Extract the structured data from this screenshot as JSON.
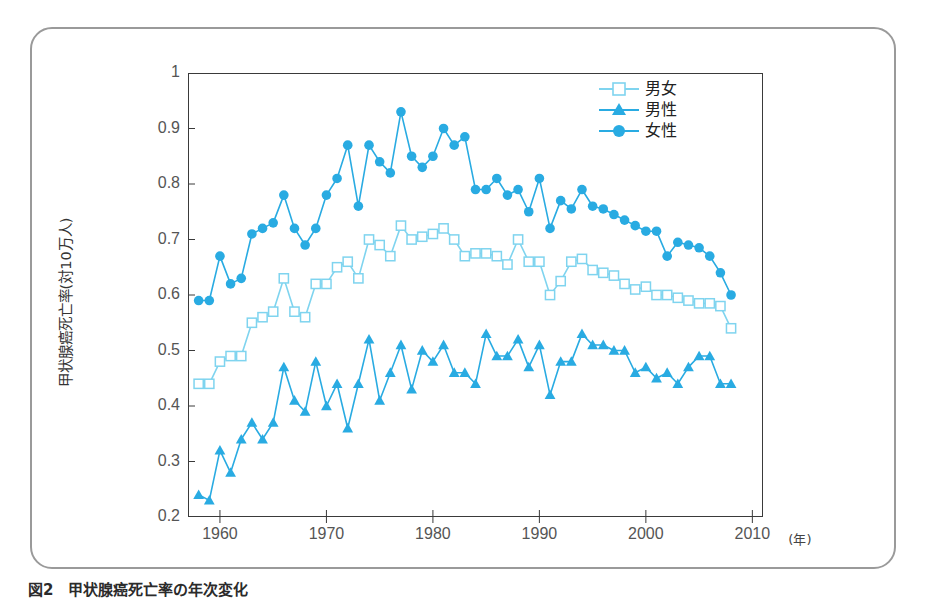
{
  "figure": {
    "top_fragment": "",
    "caption": "図2　甲状腺癌死亡率の年次変化"
  },
  "axes": {
    "y_title": "甲状腺癌死亡率(対10万人)",
    "y_ticks": [
      "0.2",
      "0.3",
      "0.4",
      "0.5",
      "0.6",
      "0.7",
      "0.8",
      "0.9",
      "1"
    ],
    "x_ticks": [
      "1960",
      "1970",
      "1980",
      "1990",
      "2000",
      "2010"
    ],
    "x_unit": "(年)"
  },
  "legend": {
    "position": "top-right",
    "items": [
      {
        "label": "男女",
        "marker": "open-square",
        "color": "#7FD4EF"
      },
      {
        "label": "男性",
        "marker": "filled-triangle",
        "color": "#29ABE2"
      },
      {
        "label": "女性",
        "marker": "filled-circle",
        "color": "#29ABE2"
      }
    ]
  },
  "colors": {
    "both": "#7FD4EF",
    "male": "#29ABE2",
    "female": "#29ABE2",
    "frame": "#3a3a3a",
    "outer_frame": "#9a9a9a"
  },
  "chart_data": {
    "type": "line",
    "title": "甲状腺癌死亡率の年次変化",
    "xlabel": "年",
    "ylabel": "甲状腺癌死亡率(対10万人)",
    "xlim": [
      1957,
      2011
    ],
    "ylim": [
      0.2,
      1.0
    ],
    "grid": false,
    "legend_position": "top-right",
    "x": [
      1958,
      1959,
      1960,
      1961,
      1962,
      1963,
      1964,
      1965,
      1966,
      1967,
      1968,
      1969,
      1970,
      1971,
      1972,
      1973,
      1974,
      1975,
      1976,
      1977,
      1978,
      1979,
      1980,
      1981,
      1982,
      1983,
      1984,
      1985,
      1986,
      1987,
      1988,
      1989,
      1990,
      1991,
      1992,
      1993,
      1994,
      1995,
      1996,
      1997,
      1998,
      1999,
      2000,
      2001,
      2002,
      2003,
      2004,
      2005,
      2006,
      2007,
      2008
    ],
    "series": [
      {
        "name": "男女",
        "marker": "open-square",
        "color": "#7FD4EF",
        "values": [
          0.44,
          0.44,
          0.48,
          0.49,
          0.49,
          0.55,
          0.56,
          0.57,
          0.63,
          0.57,
          0.56,
          0.62,
          0.62,
          0.65,
          0.66,
          0.63,
          0.7,
          0.69,
          0.67,
          0.725,
          0.7,
          0.705,
          0.71,
          0.72,
          0.7,
          0.67,
          0.675,
          0.675,
          0.67,
          0.655,
          0.7,
          0.66,
          0.66,
          0.6,
          0.625,
          0.66,
          0.665,
          0.645,
          0.64,
          0.635,
          0.62,
          0.61,
          0.615,
          0.6,
          0.6,
          0.595,
          0.59,
          0.585,
          0.585,
          0.58,
          0.54
        ]
      },
      {
        "name": "男性",
        "marker": "filled-triangle",
        "color": "#29ABE2",
        "values": [
          0.24,
          0.23,
          0.32,
          0.28,
          0.34,
          0.37,
          0.34,
          0.37,
          0.47,
          0.41,
          0.39,
          0.48,
          0.4,
          0.44,
          0.36,
          0.44,
          0.52,
          0.41,
          0.46,
          0.51,
          0.43,
          0.5,
          0.48,
          0.51,
          0.46,
          0.46,
          0.44,
          0.53,
          0.49,
          0.49,
          0.52,
          0.47,
          0.51,
          0.42,
          0.48,
          0.48,
          0.53,
          0.51,
          0.51,
          0.5,
          0.5,
          0.46,
          0.47,
          0.45,
          0.46,
          0.44,
          0.47,
          0.49,
          0.49,
          0.44,
          0.44
        ]
      },
      {
        "name": "女性",
        "marker": "filled-circle",
        "color": "#29ABE2",
        "values": [
          0.59,
          0.59,
          0.67,
          0.62,
          0.63,
          0.71,
          0.72,
          0.73,
          0.78,
          0.72,
          0.69,
          0.72,
          0.78,
          0.81,
          0.87,
          0.76,
          0.87,
          0.84,
          0.82,
          0.93,
          0.85,
          0.83,
          0.85,
          0.9,
          0.87,
          0.885,
          0.79,
          0.79,
          0.81,
          0.78,
          0.79,
          0.75,
          0.81,
          0.72,
          0.77,
          0.755,
          0.79,
          0.76,
          0.755,
          0.745,
          0.735,
          0.725,
          0.715,
          0.715,
          0.67,
          0.695,
          0.69,
          0.685,
          0.67,
          0.64,
          0.6
        ]
      }
    ]
  }
}
